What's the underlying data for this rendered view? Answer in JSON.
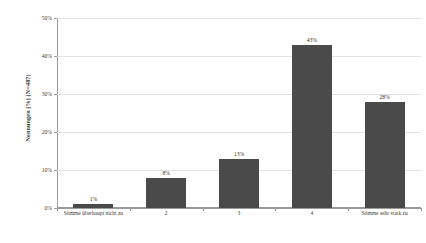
{
  "chart_data": {
    "type": "bar",
    "title": "",
    "subtitle": "",
    "xlabel": "",
    "ylabel": "Nennungen [%] (N=487)",
    "ylim": [
      0,
      50
    ],
    "ytick_labels": [
      "0%",
      "10%",
      "20%",
      "30%",
      "40%",
      "50%"
    ],
    "ytick_values": [
      0,
      10,
      20,
      30,
      40,
      50
    ],
    "grid": true,
    "legend": false,
    "bar_color": "#4a4a4a",
    "categories": [
      "Stimme überhaupt nicht zu",
      "2",
      "3",
      "4",
      "Stimme sehr stark zu"
    ],
    "values": [
      1,
      8,
      13,
      43,
      28
    ],
    "data_labels": [
      "1%",
      "8%",
      "13%",
      "43%",
      "28%"
    ]
  },
  "axis": {
    "y_title_line1": "Nennungen [%]",
    "y_title_line2": "(N=487)"
  },
  "colors": {
    "bar": "#4a4a4a",
    "grid": "#e2e2e2",
    "axis": "#9a9a9a",
    "text": "#3a3a3a",
    "background": "#ffffff"
  }
}
